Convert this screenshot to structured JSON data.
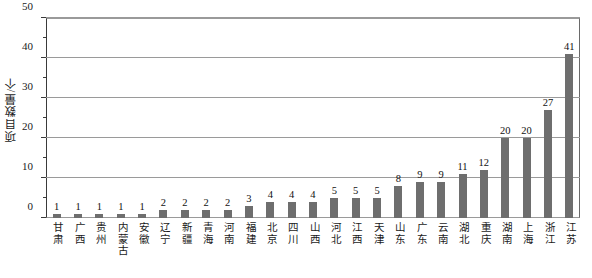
{
  "chart_data": {
    "type": "bar",
    "title": "",
    "subtitle": "",
    "xlabel": "",
    "ylabel": "项目数量/个",
    "ylim": [
      0,
      50
    ],
    "ytick_labels": [
      "0",
      "10",
      "20",
      "30",
      "40",
      "50"
    ],
    "ytick_values": [
      0,
      10,
      20,
      30,
      40,
      50
    ],
    "yminor_values": [
      5,
      15,
      25,
      35,
      45
    ],
    "grid": "horizontal",
    "legend": "none",
    "bar_color": "#6e6e6e",
    "categories": [
      "甘肃",
      "广西",
      "贵州",
      "内蒙古",
      "安徽",
      "辽宁",
      "新疆",
      "青海",
      "河南",
      "福建",
      "北京",
      "四川",
      "山西",
      "河北",
      "江西",
      "天津",
      "山东",
      "广东",
      "云南",
      "湖北",
      "重庆",
      "湖南",
      "上海",
      "浙江",
      "江苏"
    ],
    "values": [
      1,
      1,
      1,
      1,
      1,
      2,
      2,
      2,
      2,
      3,
      4,
      4,
      4,
      5,
      5,
      5,
      8,
      9,
      9,
      11,
      12,
      20,
      20,
      27,
      41
    ],
    "data_labels": [
      "1",
      "1",
      "1",
      "1",
      "1",
      "2",
      "2",
      "2",
      "2",
      "3",
      "4",
      "4",
      "4",
      "5",
      "5",
      "5",
      "8",
      "9",
      "9",
      "11",
      "12",
      "20",
      "20",
      "27",
      "41"
    ]
  }
}
